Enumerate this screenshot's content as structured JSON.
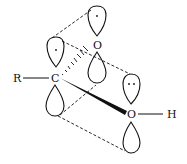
{
  "diagram": {
    "type": "orbital-diagram",
    "atoms": {
      "r_group": "R",
      "carbon": "C",
      "oxygen_top": "O",
      "oxygen_right": "O",
      "hydrogen": "H"
    },
    "electron_marks": {
      "single_dot": "·",
      "lone_pair": "··"
    },
    "colors": {
      "ink": "#111111",
      "background": "#ffffff"
    }
  }
}
